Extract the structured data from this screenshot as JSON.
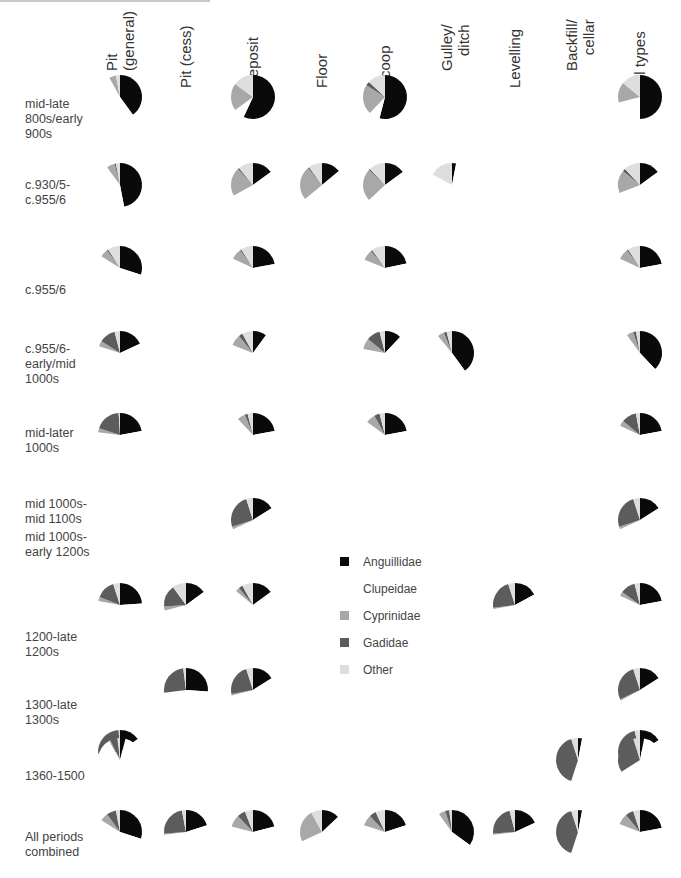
{
  "chart_data": {
    "type": "pie",
    "title": "",
    "layout": "grid of pie charts: rows = periods, columns = context types; slices drawn clockwise from 12 o'clock",
    "series_order": [
      "Anguillidae",
      "Clupeidae",
      "Cyprinidae",
      "Gadidae",
      "Other"
    ],
    "colors": {
      "Anguillidae": "#0a0a0a",
      "Clupeidae": "#ffffff",
      "Cyprinidae": "#a8a8a8",
      "Gadidae": "#5c5c5c",
      "Other": "#dedede"
    },
    "columns": [
      "Pit (general)",
      "Pit (cess)",
      "Deposit",
      "Floor",
      "Scoop",
      "Gulley/ ditch",
      "Levelling",
      "Backfill/ cellar",
      "All types"
    ],
    "rows": [
      "mid-late 800s/early 900s",
      "c.930/5-c.955/6",
      "c.955/6",
      "c.955/6-early/mid 1000s",
      "mid-later 1000s",
      "mid 1000s-mid 1100s",
      "mid 1000s-early 1200s",
      "1200-late 1200s",
      "1300-late 1300s",
      "1360-1500",
      "All periods combined"
    ],
    "pies": [
      {
        "row": 0,
        "col": 0,
        "values": [
          40,
          52,
          5,
          0,
          3
        ]
      },
      {
        "row": 0,
        "col": 2,
        "values": [
          57,
          8,
          20,
          0,
          15
        ]
      },
      {
        "row": 0,
        "col": 4,
        "values": [
          54,
          8,
          22,
          3,
          13
        ]
      },
      {
        "row": 0,
        "col": 8,
        "values": [
          50,
          21,
          15,
          0,
          14
        ]
      },
      {
        "row": 1,
        "col": 0,
        "values": [
          47,
          43,
          6,
          1,
          3
        ]
      },
      {
        "row": 1,
        "col": 2,
        "values": [
          15,
          52,
          21,
          1,
          11
        ]
      },
      {
        "row": 1,
        "col": 4,
        "values": [
          15,
          48,
          24,
          1,
          12
        ]
      },
      {
        "row": 1,
        "col": 3,
        "values": [
          14,
          50,
          25,
          1,
          10
        ]
      },
      {
        "row": 1,
        "col": 5,
        "values": [
          3,
          80,
          0,
          0,
          17
        ]
      },
      {
        "row": 1,
        "col": 8,
        "values": [
          15,
          54,
          17,
          2,
          12
        ]
      },
      {
        "row": 2,
        "col": 0,
        "values": [
          30,
          54,
          6,
          1,
          9
        ]
      },
      {
        "row": 2,
        "col": 2,
        "values": [
          22,
          60,
          8,
          1,
          9
        ]
      },
      {
        "row": 2,
        "col": 4,
        "values": [
          22,
          60,
          8,
          1,
          10
        ]
      },
      {
        "row": 2,
        "col": 8,
        "values": [
          22,
          60,
          8,
          1,
          9
        ]
      },
      {
        "row": 3,
        "col": 0,
        "values": [
          18,
          62,
          4,
          12,
          4
        ]
      },
      {
        "row": 3,
        "col": 2,
        "values": [
          10,
          71,
          8,
          3,
          8
        ]
      },
      {
        "row": 3,
        "col": 4,
        "values": [
          12,
          66,
          8,
          10,
          4
        ]
      },
      {
        "row": 3,
        "col": 5,
        "values": [
          40,
          49,
          5,
          2,
          4
        ]
      },
      {
        "row": 3,
        "col": 8,
        "values": [
          38,
          52,
          5,
          2,
          3
        ]
      },
      {
        "row": 4,
        "col": 0,
        "values": [
          22,
          55,
          3,
          19,
          1
        ]
      },
      {
        "row": 4,
        "col": 2,
        "values": [
          22,
          66,
          6,
          2,
          4
        ]
      },
      {
        "row": 4,
        "col": 4,
        "values": [
          22,
          63,
          7,
          4,
          4
        ]
      },
      {
        "row": 4,
        "col": 8,
        "values": [
          22,
          60,
          4,
          11,
          3
        ]
      },
      {
        "row": 5,
        "col": 2,
        "values": [
          16,
          52,
          2,
          25,
          5
        ]
      },
      {
        "row": 5,
        "col": 8,
        "values": [
          16,
          52,
          2,
          25,
          5
        ]
      },
      {
        "row": 6,
        "col": 0,
        "values": [
          24,
          54,
          3,
          14,
          5
        ]
      },
      {
        "row": 6,
        "col": 1,
        "values": [
          15,
          56,
          3,
          16,
          10
        ]
      },
      {
        "row": 6,
        "col": 2,
        "values": [
          15,
          71,
          3,
          3,
          8
        ]
      },
      {
        "row": 6,
        "col": 6,
        "values": [
          17,
          55,
          1,
          22,
          5
        ]
      },
      {
        "row": 6,
        "col": 8,
        "values": [
          22,
          60,
          3,
          11,
          4
        ]
      },
      {
        "row": 7,
        "col": 1,
        "values": [
          26,
          47,
          0,
          25,
          2
        ]
      },
      {
        "row": 7,
        "col": 2,
        "values": [
          16,
          55,
          1,
          23,
          5
        ]
      },
      {
        "row": 7,
        "col": 8,
        "values": [
          16,
          51,
          1,
          27,
          5
        ]
      },
      {
        "row": 8,
        "col": 0,
        "values": [
          15,
          59,
          0,
          25,
          1
        ]
      },
      {
        "row": 8,
        "col": 8,
        "values": [
          16,
          56,
          0,
          24,
          4
        ]
      },
      {
        "row": 9,
        "col": 0,
        "values": [
          4,
          88,
          1,
          5,
          2
        ]
      },
      {
        "row": 9,
        "col": 7,
        "values": [
          3,
          52,
          0,
          40,
          5
        ]
      },
      {
        "row": 9,
        "col": 8,
        "values": [
          3,
          63,
          0,
          29,
          5
        ]
      },
      {
        "row": 10,
        "col": 0,
        "values": [
          30,
          54,
          6,
          7,
          3
        ]
      },
      {
        "row": 10,
        "col": 1,
        "values": [
          20,
          53,
          1,
          23,
          3
        ]
      },
      {
        "row": 10,
        "col": 2,
        "values": [
          21,
          58,
          9,
          6,
          6
        ]
      },
      {
        "row": 10,
        "col": 3,
        "values": [
          13,
          55,
          24,
          0,
          8
        ]
      },
      {
        "row": 10,
        "col": 4,
        "values": [
          20,
          60,
          8,
          5,
          7
        ]
      },
      {
        "row": 10,
        "col": 5,
        "values": [
          35,
          55,
          5,
          3,
          2
        ]
      },
      {
        "row": 10,
        "col": 6,
        "values": [
          18,
          55,
          1,
          22,
          4
        ]
      },
      {
        "row": 10,
        "col": 7,
        "values": [
          3,
          52,
          0,
          40,
          5
        ]
      },
      {
        "row": 10,
        "col": 8,
        "values": [
          22,
          59,
          8,
          6,
          5
        ]
      }
    ]
  },
  "header": {
    "columns": [
      {
        "lines": [
          "Pit",
          "(general)"
        ]
      },
      {
        "lines": [
          "Pit (cess)"
        ]
      },
      {
        "lines": [
          "Deposit"
        ]
      },
      {
        "lines": [
          "Floor"
        ]
      },
      {
        "lines": [
          "Scoop"
        ]
      },
      {
        "lines": [
          "Gulley/",
          "ditch"
        ]
      },
      {
        "lines": [
          "Levelling"
        ]
      },
      {
        "lines": [
          "Backfill/",
          "cellar"
        ]
      },
      {
        "lines": [
          "All types"
        ]
      }
    ]
  },
  "rows": [
    {
      "label": "mid-late 800s/early 900s"
    },
    {
      "label": "c.930/5- c.955/6"
    },
    {
      "label": "c.955/6"
    },
    {
      "label": "c.955/6- early/mid 1000s"
    },
    {
      "label": "mid-later 1000s"
    },
    {
      "label": "mid 1000s-mid 1100s"
    },
    {
      "label": "mid 1000s- early 1200s"
    },
    {
      "label": "1200-late 1200s"
    },
    {
      "label": "1300-late 1300s"
    },
    {
      "label": "1360-1500"
    },
    {
      "label": "All periods combined"
    }
  ],
  "legend": {
    "items": [
      {
        "label": "Anguillidae",
        "color": "#0a0a0a"
      },
      {
        "label": "Clupeidae",
        "color": "#ffffff"
      },
      {
        "label": "Cyprinidae",
        "color": "#a8a8a8"
      },
      {
        "label": "Gadidae",
        "color": "#5c5c5c"
      },
      {
        "label": "Other",
        "color": "#dedede"
      }
    ]
  }
}
